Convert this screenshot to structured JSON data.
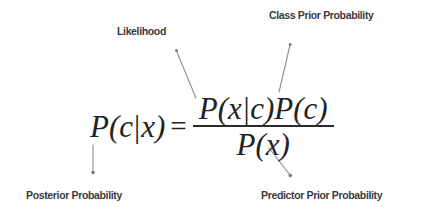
{
  "figure": {
    "background_color": "#ffffff",
    "text_color": "#3a3a3c",
    "formula_color": "#232323"
  },
  "equation": {
    "lhs": {
      "p": "P",
      "open": "(",
      "target": "c",
      "bar": "|",
      "given": "x",
      "close": ")"
    },
    "equals": "=",
    "numerator": {
      "first_term": "P(x|c)",
      "second_term": "P(c)",
      "full": "P(x|c)P(c)"
    },
    "denominator": {
      "full": "P(x)"
    },
    "full_text": "P(c|x) = P(x|c)P(c) / P(x)"
  },
  "labels": {
    "likelihood": "Likelihood",
    "class_prior": "Class Prior Probability",
    "posterior": "Posterior Probability",
    "predictor_prior": "Predictor Prior Probability"
  },
  "connectors": [
    {
      "name": "likelihood-connector",
      "from_label": "Likelihood",
      "to_part": "P(x|c)",
      "style": "diagonal-line-with-arrowhead-at-top"
    },
    {
      "name": "class-prior-connector",
      "from_label": "Class Prior Probability",
      "to_part": "P(c)",
      "style": "diagonal-line-with-arrowhead-at-top"
    },
    {
      "name": "posterior-connector",
      "from_label": "Posterior Probability",
      "to_part": "P(c|x)",
      "style": "vertical-line-with-arrowhead-at-bottom"
    },
    {
      "name": "predictor-prior-connector",
      "from_label": "Predictor Prior Probability",
      "to_part": "P(x)",
      "style": "diagonal-line-with-arrowhead-at-bottom"
    }
  ]
}
